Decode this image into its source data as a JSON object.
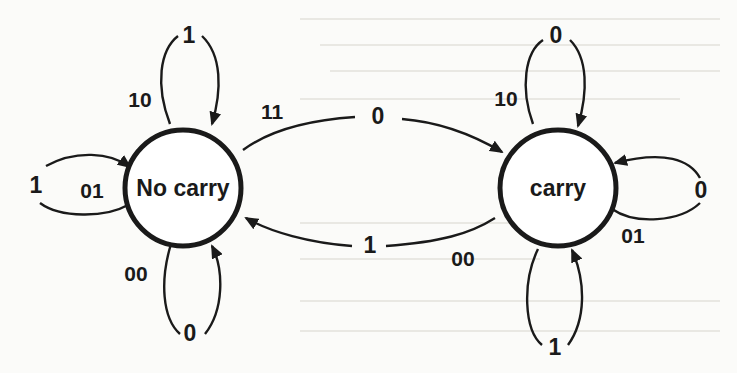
{
  "diagram": {
    "type": "state-transition diagram (serial adder)",
    "states": [
      {
        "id": "no_carry",
        "label": "No carry"
      },
      {
        "id": "carry",
        "label": "carry"
      }
    ],
    "transitions": [
      {
        "from": "no_carry",
        "to": "no_carry",
        "input": "10",
        "output": "1",
        "position": "top"
      },
      {
        "from": "no_carry",
        "to": "no_carry",
        "input": "01",
        "output": "1",
        "position": "left"
      },
      {
        "from": "no_carry",
        "to": "no_carry",
        "input": "00",
        "output": "0",
        "position": "bottom"
      },
      {
        "from": "no_carry",
        "to": "carry",
        "input": "11",
        "output": "0",
        "position": "upper-middle"
      },
      {
        "from": "carry",
        "to": "no_carry",
        "input": "00",
        "output": "1",
        "position": "lower-middle"
      },
      {
        "from": "carry",
        "to": "carry",
        "input": "10",
        "output": "0",
        "position": "top"
      },
      {
        "from": "carry",
        "to": "carry",
        "input": "01",
        "output": "0",
        "position": "right"
      },
      {
        "from": "carry",
        "to": "carry",
        "input": "11",
        "output": "1",
        "position": "bottom"
      }
    ],
    "labels": {
      "nc_top_in": "10",
      "nc_top_out": "1",
      "nc_left_in": "01",
      "nc_left_out": "1",
      "nc_bottom_in": "00",
      "nc_bottom_out": "0",
      "to_carry_in": "11",
      "to_carry_out": "0",
      "to_nocarry_in": "00",
      "to_nocarry_out": "1",
      "c_top_in": "10",
      "c_top_out": "0",
      "c_right_in": "01",
      "c_right_out": "0",
      "c_bottom_out": "1"
    }
  }
}
